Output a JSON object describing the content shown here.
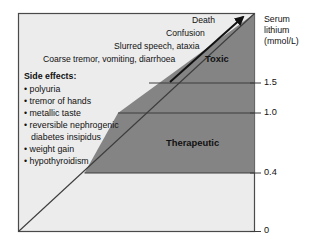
{
  "figure": {
    "title_region": "lithium-serum-concentration-effects-diagram",
    "colors": {
      "plot_background": "#ececec",
      "band_fill": "#848484",
      "border": "#4a4a4a",
      "text": "#111111",
      "page_background": "#ffffff"
    }
  },
  "axis": {
    "title_lines": [
      "Serum",
      "lithium",
      "(mmol/L)"
    ],
    "ticks": [
      {
        "label": "1.5",
        "value": 1.5,
        "y": 83
      },
      {
        "label": "1.0",
        "value": 1.0,
        "y": 113
      },
      {
        "label": "0.4",
        "value": 0.4,
        "y": 173
      },
      {
        "label": "0",
        "value": 0,
        "y": 231
      }
    ]
  },
  "toxicity_progression": {
    "arrow_name": "increasing-toxicity-arrow",
    "lines": [
      {
        "label": "Death",
        "x": 192,
        "y": 20
      },
      {
        "label": "Confusion",
        "x": 168,
        "y": 33
      },
      {
        "label": "Slurred speech, ataxia",
        "x": 120,
        "y": 46
      },
      {
        "label": "Coarse tremor, vomiting, diarrhoea",
        "x": 55,
        "y": 59
      }
    ]
  },
  "zones": [
    {
      "name": "toxic",
      "label": "Toxic",
      "x": 205,
      "y": 57
    },
    {
      "name": "therapeutic",
      "label": "Therapeutic",
      "x": 166,
      "y": 141
    }
  ],
  "side_effects": {
    "heading": "Side effects:",
    "items": [
      {
        "text": "polyuria"
      },
      {
        "text": "tremor of hands"
      },
      {
        "text": "metallic taste"
      },
      {
        "text": "reversible nephrogenic",
        "continuation": "diabetes insipidus"
      },
      {
        "text": "weight gain"
      },
      {
        "text": "hypothyroidism"
      }
    ]
  }
}
